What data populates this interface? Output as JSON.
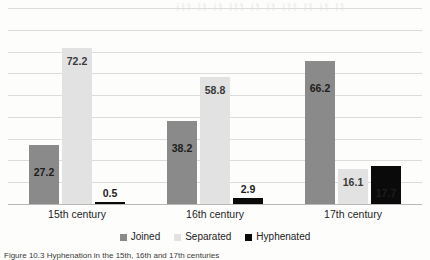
{
  "figure": {
    "caption": "Figure 10.3 Hyphenation in the 15th, 16th and 17th centuries",
    "bleed_through": "fl fi fl ffi fl fi ffl fi fl ffi"
  },
  "chart_data": {
    "type": "bar",
    "title": "",
    "subtitle": "",
    "xlabel": "",
    "ylabel": "",
    "categories": [
      "15th century",
      "16th century",
      "17th century"
    ],
    "series": [
      {
        "name": "Joined",
        "color": "#8a8a8a",
        "values": [
          27.2,
          38.2,
          66.2
        ]
      },
      {
        "name": "Separated",
        "color": "#e2e2e2",
        "values": [
          72.2,
          58.8,
          16.1
        ]
      },
      {
        "name": "Hyphenated",
        "color": "#0a0a0a",
        "values": [
          0.5,
          2.9,
          17.7
        ]
      }
    ],
    "value_labels": [
      [
        "27.2",
        "72.2",
        "0.5"
      ],
      [
        "38.2",
        "58.8",
        "2.9"
      ],
      [
        "66.2",
        "16.1",
        "17.7"
      ]
    ],
    "ylim": [
      0,
      90
    ],
    "y_tick_labels": [],
    "gridlines": 9,
    "grid": true,
    "legend_position": "bottom",
    "legend": [
      "Joined",
      "Separated",
      "Hyphenated"
    ]
  },
  "colors": {
    "grid": "#dcdcdc",
    "baseline": "#b9b9b9",
    "paper": "#fdfdfc",
    "text": "#1d1d1d"
  }
}
